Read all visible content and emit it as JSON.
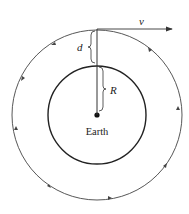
{
  "diagram": {
    "labels": {
      "velocity": "v",
      "altitude": "d",
      "radius": "R",
      "planet": "Earth"
    },
    "colors": {
      "stroke": "#333333",
      "background": "#ffffff"
    },
    "orbit_direction": "clockwise"
  }
}
